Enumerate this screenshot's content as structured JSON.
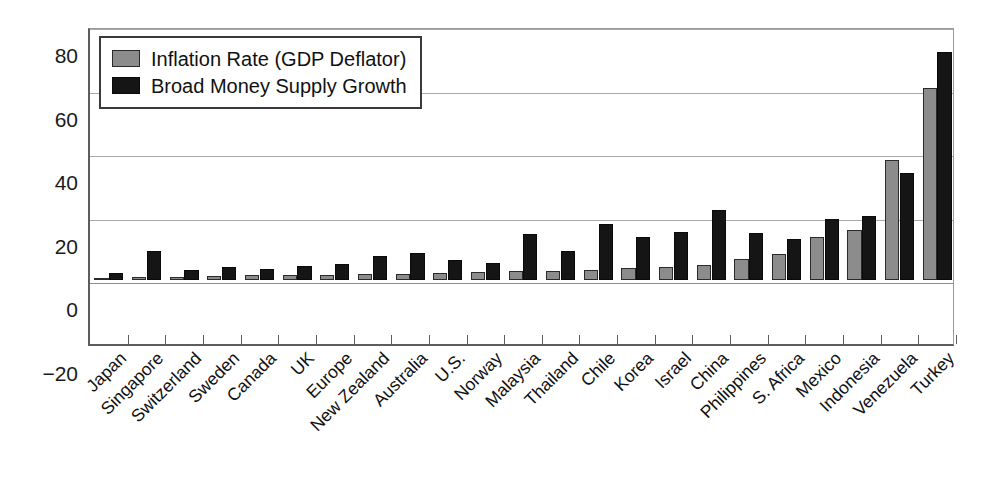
{
  "chart_data": {
    "type": "bar",
    "title": "",
    "subtitle": "",
    "xlabel": "",
    "ylabel": "",
    "ylim": [
      -20,
      80
    ],
    "yticks": [
      80,
      60,
      40,
      20,
      0,
      -20
    ],
    "ytick_labels": [
      "80",
      "60",
      "40",
      "20",
      "0",
      "−20"
    ],
    "grid": true,
    "legend_position": "top-left",
    "categories": [
      "Japan",
      "Singapore",
      "Switzerland",
      "Sweden",
      "Canada",
      "UK",
      "Europe",
      "New Zealand",
      "Australia",
      "U.S.",
      "Norway",
      "Malaysia",
      "Thailand",
      "Chile",
      "Korea",
      "Israel",
      "China",
      "Philippines",
      "S. Africa",
      "Mexico",
      "Indonesia",
      "Venezuela",
      "Turkey"
    ],
    "series": [
      {
        "name": "Inflation Rate (GDP Deflator)",
        "color": "#8c8c8c",
        "values": [
          0.5,
          1.0,
          1.0,
          1.5,
          1.8,
          1.8,
          1.8,
          2.0,
          2.0,
          2.2,
          2.6,
          3.0,
          3.0,
          3.4,
          3.9,
          4.2,
          4.7,
          6.6,
          8.4,
          13.6,
          15.7,
          38.0,
          60.5
        ]
      },
      {
        "name": "Broad Money Supply Growth",
        "color": "#151515",
        "values": [
          2.4,
          9.4,
          3.2,
          4.2,
          3.6,
          4.6,
          5.1,
          7.7,
          8.5,
          6.3,
          5.5,
          14.5,
          9.1,
          17.6,
          13.7,
          15.2,
          22.2,
          14.9,
          12.9,
          19.4,
          20.3,
          33.8,
          71.8
        ]
      }
    ]
  },
  "legend": {
    "items": [
      {
        "label": "Inflation Rate (GDP Deflator)",
        "swatch": "inflation"
      },
      {
        "label": "Broad Money Supply Growth",
        "swatch": "money"
      }
    ]
  },
  "axis": {
    "y_tick_labels": [
      "80",
      "60",
      "40",
      "20",
      "0",
      "−20"
    ]
  }
}
